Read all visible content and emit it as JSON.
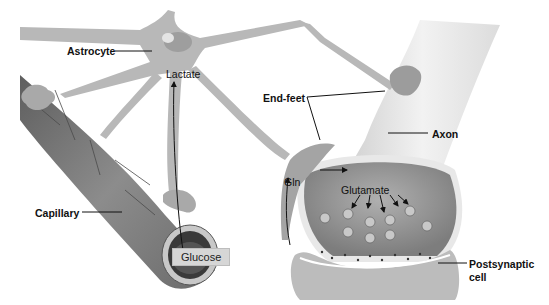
{
  "diagram": {
    "type": "biological-illustration",
    "colors": {
      "background": "#ffffff",
      "astrocyte": "#b8b8b8",
      "capillary": "#7a7a7a",
      "axon": "#e6e6e6",
      "terminal_inside": "#9a9a9a",
      "label_text": "#111111"
    },
    "labels": {
      "astrocyte": "Astrocyte",
      "lactate": "Lactate",
      "end_feet": "End-feet",
      "axon": "Axon",
      "capillary": "Capillary",
      "glucose": "Glucose",
      "gln": "Gln",
      "glutamate": "Glutamate",
      "postsynaptic_line1": "Postsynaptic",
      "postsynaptic_line2": "cell"
    },
    "flows": [
      {
        "from": "Glucose",
        "to": "Lactate",
        "via": "astrocyte process"
      },
      {
        "from": "Gln",
        "to": "Glutamate",
        "via": "presynaptic terminal"
      },
      {
        "from": "synaptic cleft",
        "to": "Gln",
        "via": "astrocyte end-foot"
      }
    ]
  }
}
